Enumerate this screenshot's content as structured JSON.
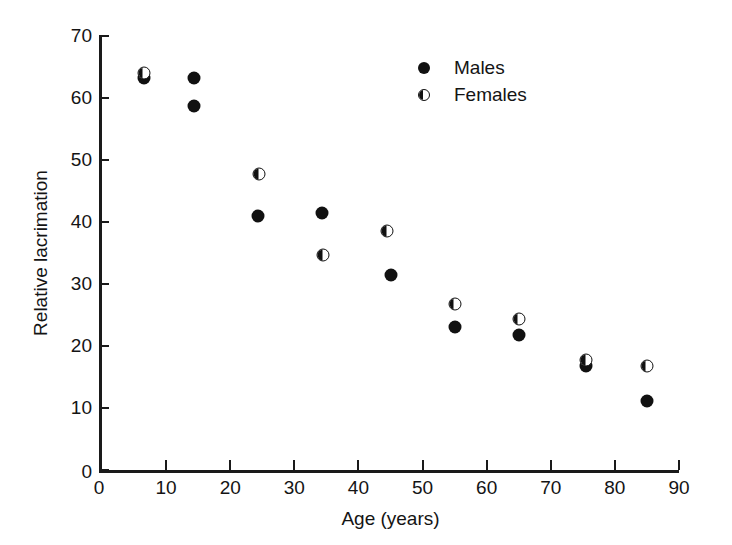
{
  "chart_data": {
    "type": "scatter",
    "title": "",
    "xlabel": "Age (years)",
    "ylabel": "Relative lacrimation",
    "xlim": [
      0,
      90
    ],
    "ylim": [
      0,
      70
    ],
    "xticks": [
      0,
      10,
      20,
      30,
      40,
      50,
      60,
      70,
      80,
      90
    ],
    "yticks": [
      0,
      10,
      20,
      30,
      40,
      50,
      60,
      70
    ],
    "xtick_labels": [
      "0",
      "10",
      "20",
      "30",
      "40",
      "50",
      "60",
      "70",
      "80",
      "90"
    ],
    "ytick_labels": [
      "0",
      "10",
      "20",
      "30",
      "40",
      "50",
      "60",
      "70"
    ],
    "grid": false,
    "legend_position": "top-right",
    "series": [
      {
        "name": "Males",
        "marker": "filled-circle",
        "color": "#111111",
        "points": [
          {
            "x": 6.5,
            "y": 63.3
          },
          {
            "x": 14.3,
            "y": 63.3
          },
          {
            "x": 14.3,
            "y": 58.7
          },
          {
            "x": 24.3,
            "y": 41.0
          },
          {
            "x": 34.3,
            "y": 41.5
          },
          {
            "x": 45.0,
            "y": 31.5
          },
          {
            "x": 55.0,
            "y": 23.0
          },
          {
            "x": 65.0,
            "y": 21.7
          },
          {
            "x": 75.5,
            "y": 16.8
          },
          {
            "x": 85.0,
            "y": 11.2
          }
        ]
      },
      {
        "name": "Females",
        "marker": "half-filled-circle",
        "color": "#111111",
        "points": [
          {
            "x": 6.5,
            "y": 64.0
          },
          {
            "x": 24.5,
            "y": 47.8
          },
          {
            "x": 34.5,
            "y": 34.7
          },
          {
            "x": 44.5,
            "y": 38.6
          },
          {
            "x": 55.0,
            "y": 26.7
          },
          {
            "x": 65.0,
            "y": 24.3
          },
          {
            "x": 75.5,
            "y": 17.8
          },
          {
            "x": 85.0,
            "y": 16.7
          }
        ]
      }
    ]
  },
  "legend": {
    "entries": [
      {
        "label": "Males",
        "marker": "filled-circle"
      },
      {
        "label": "Females",
        "marker": "half-filled-circle"
      }
    ]
  },
  "colors": {
    "marker": "#111111",
    "axis": "#1a1a1a",
    "text": "#141414",
    "background": "#ffffff"
  }
}
